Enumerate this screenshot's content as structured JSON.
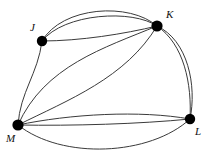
{
  "figure": {
    "kind": "multigraph-diagram",
    "background_color": "#ffffff",
    "edge_color": "#3a3a3a",
    "vertex_color": "#000000",
    "label_color": "#111111",
    "canvas": {
      "width": 204,
      "height": 156
    }
  },
  "vertices": [
    {
      "id": "J",
      "label": "J",
      "x": 42,
      "y": 41,
      "r": 5.2,
      "label_x": 30,
      "label_y": 22
    },
    {
      "id": "K",
      "label": "K",
      "x": 157,
      "y": 26,
      "r": 5.6,
      "label_x": 166,
      "label_y": 9
    },
    {
      "id": "L",
      "label": "L",
      "x": 190,
      "y": 119,
      "r": 5.2,
      "label_x": 195,
      "label_y": 126
    },
    {
      "id": "M",
      "label": "M",
      "x": 18,
      "y": 125,
      "r": 5.6,
      "label_x": 6,
      "label_y": 133
    }
  ],
  "edges": [
    {
      "id": "e1",
      "from": "J",
      "to": "K",
      "multiplicity_index": 1,
      "path": "M 42 41 C 62 6 130 2 157 26"
    },
    {
      "id": "e2",
      "from": "J",
      "to": "K",
      "multiplicity_index": 2,
      "path": "M 42 41 C 64 13 133 9 157 26"
    },
    {
      "id": "e3",
      "from": "J",
      "to": "K",
      "multiplicity_index": 3,
      "path": "M 42 41 C 80 41 124 34 157 26"
    },
    {
      "id": "e4",
      "from": "J",
      "to": "M",
      "multiplicity_index": 1,
      "path": "M 42 41 C 38 74 20 92 18 125"
    },
    {
      "id": "e5",
      "from": "K",
      "to": "M",
      "multiplicity_index": 1,
      "path": "M 157 26 C 104 48 44 66 18 125"
    },
    {
      "id": "e6",
      "from": "K",
      "to": "M",
      "multiplicity_index": 2,
      "path": "M 157 26 C 126 78 68 100 18 125"
    },
    {
      "id": "e7",
      "from": "K",
      "to": "L",
      "multiplicity_index": 1,
      "path": "M 157 26 C 184 44 192 84 190 119"
    },
    {
      "id": "e8",
      "from": "K",
      "to": "L",
      "multiplicity_index": 2,
      "path": "M 157 26 C 188 40 197 86 190 119"
    },
    {
      "id": "e9",
      "from": "M",
      "to": "L",
      "multiplicity_index": 1,
      "path": "M 18 125 C 70 114 140 110 190 119"
    },
    {
      "id": "e10",
      "from": "M",
      "to": "L",
      "multiplicity_index": 2,
      "path": "M 18 125 C 72 126 140 124 190 119"
    },
    {
      "id": "e11",
      "from": "M",
      "to": "L",
      "multiplicity_index": 3,
      "path": "M 18 125 C 62 160 150 156 190 119"
    }
  ],
  "edge_groups": [
    {
      "pair": "J-K",
      "count": 3
    },
    {
      "pair": "J-M",
      "count": 1
    },
    {
      "pair": "K-M",
      "count": 2
    },
    {
      "pair": "K-L",
      "count": 2
    },
    {
      "pair": "M-L",
      "count": 3
    }
  ],
  "degrees": {
    "J": 4,
    "K": 7,
    "L": 5,
    "M": 6
  }
}
